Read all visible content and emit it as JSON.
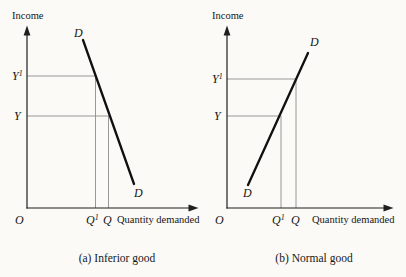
{
  "colors": {
    "background": "#fbfaf7",
    "ink": "#1f1f1f",
    "guide_line": "#8d8d8d",
    "text": "#161616"
  },
  "panel_a": {
    "y_axis_label": "Income",
    "x_axis_label": "Quantity demanded",
    "origin_label": "O",
    "curve_label": "D",
    "y_point_high_base": "Y",
    "y_point_high_sup": "1",
    "y_point_base": "Y",
    "x_point_new_base": "Q",
    "x_point_new_sup": "1",
    "x_point_base": "Q",
    "caption": "(a) Inferior good"
  },
  "panel_b": {
    "y_axis_label": "Income",
    "x_axis_label": "Quantity demanded",
    "origin_label": "O",
    "curve_label": "D",
    "y_point_high_base": "Y",
    "y_point_high_sup": "1",
    "y_point_base": "Y",
    "x_point_new_base": "Q",
    "x_point_new_sup": "1",
    "x_point_base": "Q",
    "caption": "(b) Normal good"
  }
}
